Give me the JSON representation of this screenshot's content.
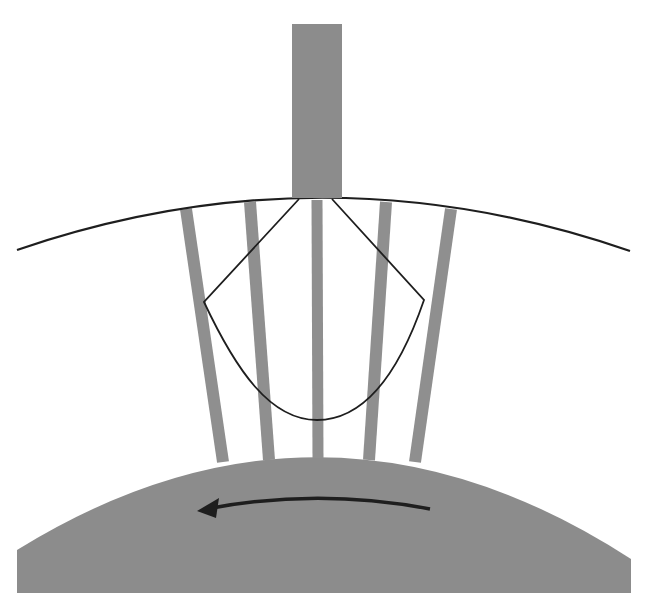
{
  "diagram": {
    "colors": {
      "background": "#ffffff",
      "fill_gray": "#8c8c8c",
      "stripe_gray": "#8f8f8f",
      "line": "#1e1e1e"
    },
    "elements": {
      "top_block": {
        "x": 292,
        "y": 24,
        "width": 50,
        "height": 174
      },
      "upper_arc": {
        "start": [
          17,
          250
        ],
        "control": [
          324,
          145
        ],
        "end": [
          630,
          251
        ]
      },
      "stripes": [
        {
          "top": [
            186,
            209
          ],
          "bottom": [
            223,
            460
          ],
          "width": 12
        },
        {
          "top": [
            250,
            202
          ],
          "bottom": [
            269,
            458
          ],
          "width": 12
        },
        {
          "top": [
            317,
            200
          ],
          "bottom": [
            318,
            456
          ],
          "width": 11
        },
        {
          "top": [
            386,
            202
          ],
          "bottom": [
            369,
            458
          ],
          "width": 12
        },
        {
          "top": [
            451,
            209
          ],
          "bottom": [
            415,
            460
          ],
          "width": 12
        }
      ],
      "bowl_outline": {
        "top_left": [
          299,
          199
        ],
        "top_right": [
          332,
          199
        ],
        "left_corner": [
          204,
          302
        ],
        "right_corner": [
          424,
          300
        ],
        "bottom": [
          317,
          420
        ]
      },
      "drum": {
        "left": 17,
        "right": 631,
        "bottom": 593,
        "peak_y": 456,
        "left_edge_y": 550,
        "right_edge_y": 559
      },
      "rotation_arrow": {
        "start": [
          430,
          509
        ],
        "control": [
          320,
          488
        ],
        "tip": [
          197,
          511
        ],
        "direction": "left"
      }
    },
    "labels": []
  }
}
